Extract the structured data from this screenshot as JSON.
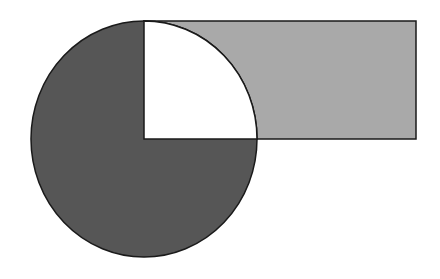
{
  "diagram": {
    "colors": {
      "background": "#ffffff",
      "circle_fill": "#565656",
      "rect_fill": "#a9a9a9",
      "quadrant_fill": "#ffffff",
      "stroke": "#1a1a1a"
    },
    "circle": {
      "cx": 144,
      "cy": 139,
      "rx": 113,
      "ry": 118
    },
    "rectangle": {
      "x": 144,
      "y": 21,
      "width": 272,
      "height": 118
    },
    "quadrant": {
      "cx": 144,
      "cy": 139,
      "rx": 113,
      "ry": 118,
      "position": "top-right"
    }
  }
}
